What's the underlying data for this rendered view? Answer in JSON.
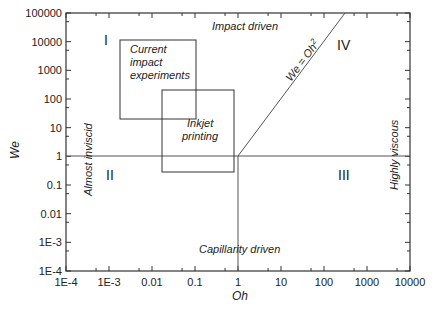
{
  "chart_data": {
    "type": "diagram-regime-map",
    "title": "",
    "xlabel": "Oh",
    "ylabel": "We",
    "xscale": "log",
    "yscale": "log",
    "xlim": [
      0.0001,
      10000
    ],
    "ylim": [
      0.0001,
      100000
    ],
    "x_ticks": [
      "1E-4",
      "1E-3",
      "0.01",
      "0.1",
      "1",
      "10",
      "100",
      "1000",
      "10000"
    ],
    "y_ticks": [
      "1E-4",
      "1E-3",
      "0.01",
      "0.1",
      "1",
      "10",
      "100",
      "1000",
      "10000",
      "100000"
    ],
    "lines": [
      {
        "name": "We = 1 horizontal",
        "points": [
          [
            0.0001,
            1
          ],
          [
            10000,
            1
          ]
        ]
      },
      {
        "name": "Oh = 1 vertical",
        "points": [
          [
            1,
            0.0001
          ],
          [
            1,
            1
          ]
        ]
      },
      {
        "name": "We = Oh^2",
        "points": [
          [
            1,
            1
          ],
          [
            316,
            100000
          ]
        ]
      }
    ],
    "boxes": [
      {
        "label": "Current impact experiments",
        "oh": [
          0.002,
          0.1
        ],
        "we": [
          20,
          12000
        ]
      },
      {
        "label": "Inkjet printing",
        "oh": [
          0.02,
          0.8
        ],
        "we": [
          0.3,
          200
        ]
      }
    ],
    "regions": [
      {
        "id": "I",
        "label": "I"
      },
      {
        "id": "II",
        "label": "II"
      },
      {
        "id": "III",
        "label": "III"
      },
      {
        "id": "IV",
        "label": "IV"
      }
    ],
    "annotations": {
      "top": "Impact driven",
      "bottom": "Capillarity driven",
      "left": "Almost inviscid",
      "right": "Highly viscous",
      "line": "We = Oh",
      "line_sup": "2"
    }
  }
}
